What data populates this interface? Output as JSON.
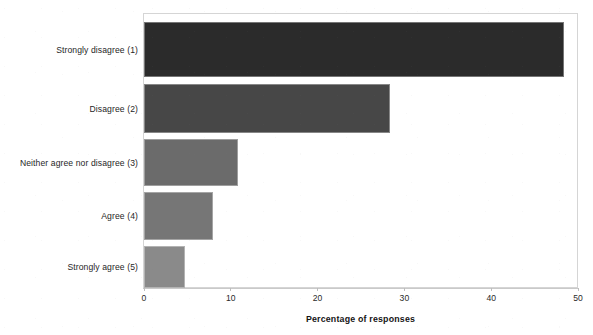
{
  "chart_data": {
    "type": "bar",
    "orientation": "horizontal",
    "title": "",
    "xlabel": "Percentage of responses",
    "ylabel": "",
    "xlim": [
      0,
      50
    ],
    "xticks": [
      0,
      10,
      20,
      30,
      40,
      50
    ],
    "xtick_labels": [
      "0",
      "10",
      "20",
      "30",
      "40",
      "50"
    ],
    "grid": false,
    "legend": false,
    "categories": [
      "Strongly disagree (1)",
      "Disagree (2)",
      "Neither agree nor disagree (3)",
      "Agree (4)",
      "Strongly agree (5)"
    ],
    "values": [
      48.4,
      28.3,
      10.8,
      7.9,
      4.7
    ],
    "bar_colors": [
      "#2b2b2b",
      "#474747",
      "#6b6b6b",
      "#767676",
      "#8a8a8a"
    ],
    "series": [
      {
        "name": "Percentage of responses",
        "values": [
          48.4,
          28.3,
          10.8,
          7.9,
          4.7
        ]
      }
    ]
  },
  "axis": {
    "x_title": "Percentage of responses"
  }
}
